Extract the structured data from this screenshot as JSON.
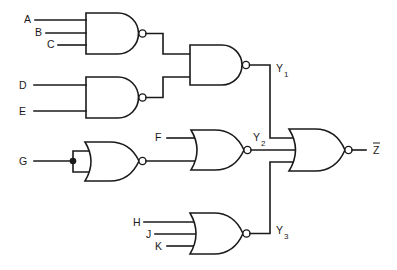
{
  "diagram": {
    "type": "logic-circuit",
    "inputs": {
      "A": "A",
      "B": "B",
      "C": "C",
      "D": "D",
      "E": "E",
      "F": "F",
      "G": "G",
      "H": "H",
      "J": "J",
      "K": "K"
    },
    "outputs": {
      "y1": {
        "base": "Y",
        "sub": "1"
      },
      "y2": {
        "base": "Y",
        "sub": "2"
      },
      "y3": {
        "base": "Y",
        "sub": "3"
      },
      "z": "Z"
    },
    "gates": [
      {
        "id": "g1",
        "type": "NAND",
        "inputs": [
          "A",
          "B",
          "C"
        ]
      },
      {
        "id": "g2",
        "type": "NAND",
        "inputs": [
          "D",
          "E"
        ]
      },
      {
        "id": "g3",
        "type": "NAND",
        "inputs": [
          "g1",
          "g2"
        ],
        "output": "Y1"
      },
      {
        "id": "g4",
        "type": "NOR",
        "inputs": [
          "G",
          "G"
        ],
        "note": "inputs tied together"
      },
      {
        "id": "g5",
        "type": "NOR",
        "inputs": [
          "F",
          "g4"
        ],
        "output": "Y2"
      },
      {
        "id": "g6",
        "type": "NOR",
        "inputs": [
          "H",
          "J",
          "K"
        ],
        "output": "Y3"
      },
      {
        "id": "g7",
        "type": "NOR",
        "inputs": [
          "Y1",
          "Y2",
          "Y3"
        ],
        "output": "Z-bar"
      }
    ],
    "colors": {
      "stroke": "#1a1a1a",
      "background": "#ffffff"
    }
  }
}
